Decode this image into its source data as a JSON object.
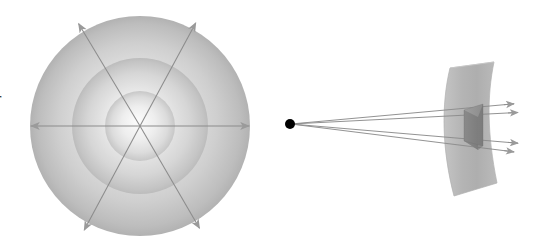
{
  "figure": {
    "background_color": "#ffffff",
    "width": 536,
    "height": 248,
    "clipped_edge_label": "r"
  },
  "palette": {
    "shell_outer_light": "#f2f2f2",
    "shell_outer_dark": "#b3b3b3",
    "shell_mid_light": "#f7f7f7",
    "shell_mid_dark": "#bdbdbd",
    "shell_inner_light": "#fbfbfb",
    "shell_inner_dark": "#c6c6c6",
    "ray_stroke": "#8c8c8c",
    "arrowhead_fill": "#9a9a9a",
    "point_source": "#000000",
    "sheet_fill": "#b9b9b9",
    "sheet_edge": "#a8a8a8",
    "patch_face": "#8e8e8e",
    "patch_side": "#777777",
    "patch_top": "#a5a5a5"
  },
  "left_panel": {
    "name": "isotropic-shells",
    "center": {
      "x": 140,
      "y": 126
    },
    "shells": [
      {
        "label": "outer-shell",
        "radius": 110
      },
      {
        "label": "middle-shell",
        "radius": 68
      },
      {
        "label": "inner-shell",
        "radius": 35
      }
    ],
    "rays": [
      {
        "label": "ray-horizontal-left",
        "x1": 140,
        "y1": 126,
        "x2": 22,
        "y2": 126
      },
      {
        "label": "ray-horizontal-right",
        "x1": 140,
        "y1": 126,
        "x2": 258,
        "y2": 126
      },
      {
        "label": "ray-diagonal-upper-left",
        "x1": 140,
        "y1": 126,
        "x2": 74,
        "y2": 16
      },
      {
        "label": "ray-diagonal-lower-right",
        "x1": 140,
        "y1": 126,
        "x2": 204,
        "y2": 236
      },
      {
        "label": "ray-diagonal-upper-right",
        "x1": 140,
        "y1": 126,
        "x2": 200,
        "y2": 15
      },
      {
        "label": "ray-diagonal-lower-left",
        "x1": 140,
        "y1": 126,
        "x2": 80,
        "y2": 238
      }
    ]
  },
  "right_panel": {
    "name": "solid-angle-cone",
    "source": {
      "label": "point-source",
      "x": 290,
      "y": 124,
      "radius": 5
    },
    "surface": {
      "label": "curved-surface-sheet",
      "description": "curved rectangular sheet, concave toward the source"
    },
    "patch": {
      "label": "surface-patch",
      "description": "dark shaded area element on the curved sheet"
    },
    "cone_rays": [
      {
        "label": "cone-ray-upper-outer",
        "x1": 291,
        "y1": 124,
        "x2": 523,
        "y2": 103
      },
      {
        "label": "cone-ray-upper-inner",
        "x1": 291,
        "y1": 124,
        "x2": 527,
        "y2": 112
      },
      {
        "label": "cone-ray-lower-inner",
        "x1": 291,
        "y1": 124,
        "x2": 527,
        "y2": 144
      },
      {
        "label": "cone-ray-lower-outer",
        "x1": 291,
        "y1": 124,
        "x2": 523,
        "y2": 153
      }
    ]
  }
}
